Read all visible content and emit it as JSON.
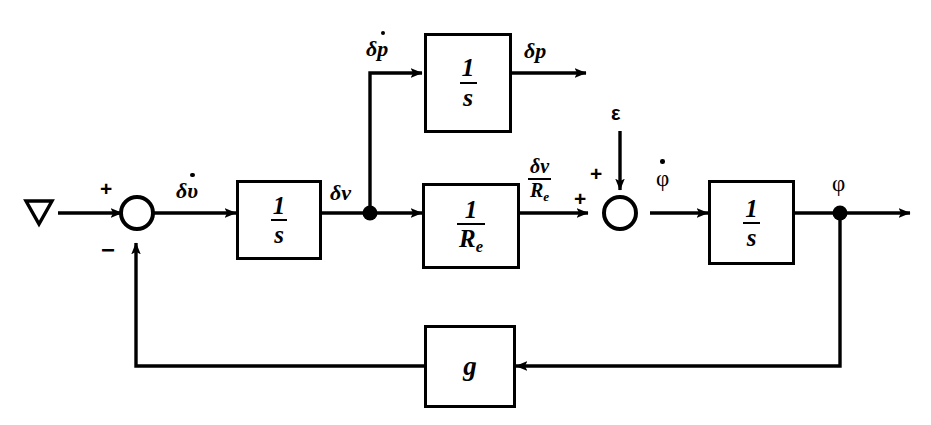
{
  "diagram": {
    "type": "control-system-block-diagram",
    "background_color": "#ffffff",
    "line_color": "#000000",
    "input": {
      "name": "nabla-source",
      "symbol": "∇"
    },
    "signs": {
      "sum1_plus": "+",
      "sum1_minus": "−",
      "sum2_plus_top": "+",
      "sum2_plus_left": "+"
    },
    "signals": {
      "delta_v_dot": {
        "base": "δv",
        "accent": "dot",
        "text": "δv̇"
      },
      "delta_v": {
        "base": "δv",
        "accent": "none",
        "text": "δv"
      },
      "delta_p_dot": {
        "base": "δp",
        "accent": "dot",
        "text": "δṗ"
      },
      "delta_p": {
        "base": "δp",
        "accent": "none",
        "text": "δp"
      },
      "epsilon": {
        "text": "ε"
      },
      "phi_dot": {
        "base": "φ",
        "accent": "dot",
        "text": "φ̇"
      },
      "phi": {
        "base": "φ",
        "accent": "none",
        "text": "φ"
      },
      "delta_v_over_Re": {
        "numerator": "δv",
        "denominator": "R",
        "denominator_sub": "e"
      }
    },
    "blocks": [
      {
        "id": "integrator-top",
        "name": "integrator-block-top",
        "numerator": "1",
        "denominator": "s",
        "kind": "fraction"
      },
      {
        "id": "integrator-left",
        "name": "integrator-block-left",
        "numerator": "1",
        "denominator": "s",
        "kind": "fraction"
      },
      {
        "id": "resistance",
        "name": "resistance-block",
        "numerator": "1",
        "denominator": "R",
        "denominator_sub": "e",
        "kind": "fraction"
      },
      {
        "id": "integrator-right",
        "name": "integrator-block-right",
        "numerator": "1",
        "denominator": "s",
        "kind": "fraction"
      },
      {
        "id": "gain",
        "name": "gain-block",
        "label": "g",
        "kind": "scalar"
      }
    ]
  }
}
